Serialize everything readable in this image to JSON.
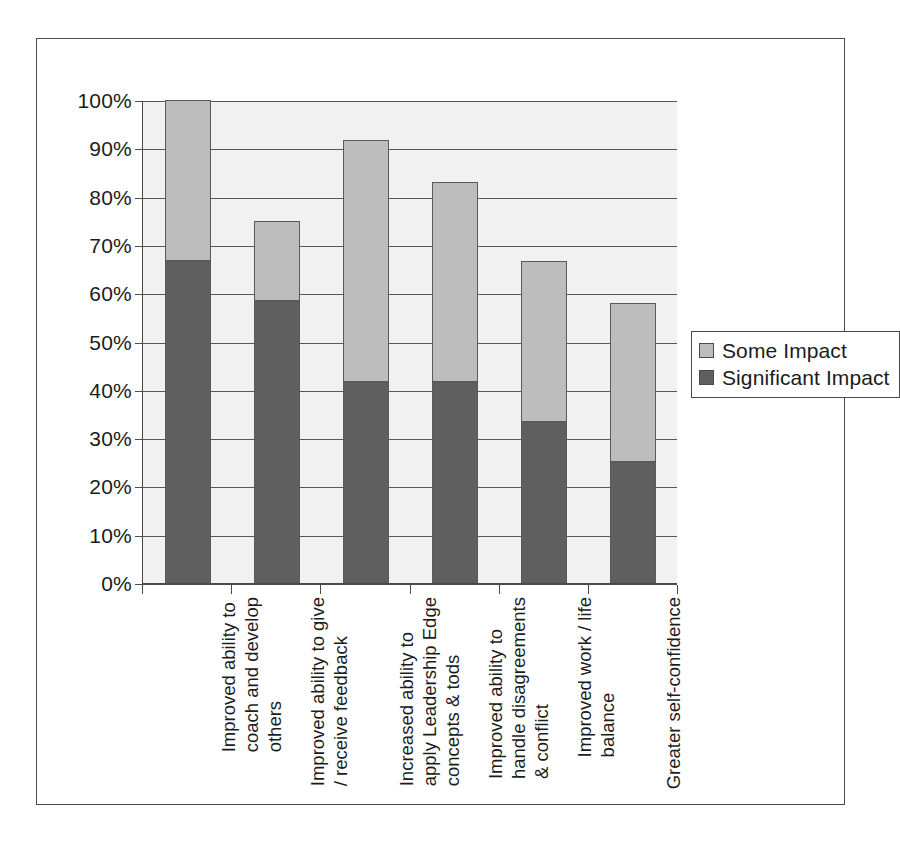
{
  "chart_data": {
    "type": "bar",
    "subtype": "stacked-bar",
    "title": "",
    "xlabel": "",
    "ylabel": "",
    "ylim": [
      0,
      100
    ],
    "y_tick_labels": [
      "0%",
      "10%",
      "20%",
      "30%",
      "40%",
      "50%",
      "60%",
      "70%",
      "80%",
      "90%",
      "100%"
    ],
    "y_tick_values": [
      0,
      10,
      20,
      30,
      40,
      50,
      60,
      70,
      80,
      90,
      100
    ],
    "grid": "horizontal",
    "legend_position": "right",
    "categories": [
      "Improved ability to coach and develop others",
      "Improved ability to give / receive feedback",
      "Increased ability to apply Leadership Edge concepts & tods",
      "Improved ability to handle disagreements & conflict",
      "Improved work / life balance",
      "Greater self-confidence"
    ],
    "category_lines": [
      [
        "Improved ability to",
        "coach and develop",
        "others"
      ],
      [
        "Improved ability to give",
        "/ receive feedback"
      ],
      [
        "Increased ability to",
        "apply Leadership Edge",
        "concepts & tods"
      ],
      [
        "Improved ability to",
        "handle disagreements",
        "& conflict"
      ],
      [
        "Improved work / life",
        "balance"
      ],
      [
        "Greater self-confidence"
      ]
    ],
    "series": [
      {
        "name": "Significant Impact",
        "color": "#5f5f5f",
        "values": [
          66.7,
          58.3,
          41.7,
          41.7,
          33.3,
          25.0
        ]
      },
      {
        "name": "Some Impact",
        "color": "#bdbdbd",
        "values": [
          33.3,
          16.7,
          50.0,
          41.3,
          33.4,
          33.0
        ]
      }
    ],
    "totals": [
      100.0,
      75.0,
      91.7,
      83.0,
      66.7,
      58.0
    ]
  },
  "legend": {
    "items": [
      {
        "label": "Some Impact",
        "color": "#bdbdbd"
      },
      {
        "label": "Significant Impact",
        "color": "#5f5f5f"
      }
    ]
  },
  "colors": {
    "significant_impact": "#5f5f5f",
    "some_impact": "#bdbdbd",
    "plot_background": "#f1f1f1",
    "gridline": "#585858",
    "axis": "#4a4a4a",
    "text": "#1c1c1c",
    "page_background": "#ffffff"
  }
}
